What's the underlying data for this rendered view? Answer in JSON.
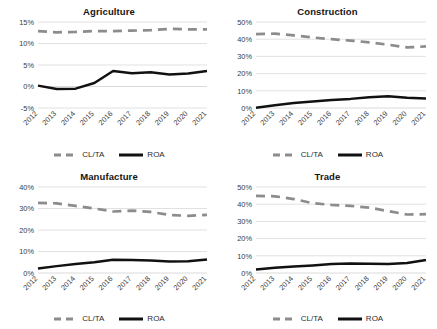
{
  "figure": {
    "background": "#ffffff",
    "panel_count": 4,
    "shared_legend_labels": [
      "CL/TA",
      "ROA"
    ],
    "series_colors": {
      "clta": "#8c8c8c",
      "roa": "#111111"
    }
  },
  "chart_data": [
    {
      "type": "line",
      "title": "Agriculture",
      "xlabel": "",
      "ylabel": "",
      "x": [
        "2012",
        "2013",
        "2014",
        "2015",
        "2016",
        "2017",
        "2018",
        "2019",
        "2020",
        "2021"
      ],
      "categories": [
        "2012",
        "2013",
        "2014",
        "2015",
        "2016",
        "2017",
        "2018",
        "2019",
        "2020",
        "2021"
      ],
      "yticks": [
        "-5%",
        "0%",
        "5%",
        "10%",
        "15%"
      ],
      "ytick_values": [
        -5,
        0,
        5,
        10,
        15
      ],
      "ylim": [
        -5,
        15
      ],
      "grid": true,
      "legend_position": "bottom",
      "series": [
        {
          "name": "CL/TA",
          "style": "dashed",
          "color": "#8c8c8c",
          "values": [
            12.9,
            12.6,
            12.7,
            12.9,
            12.9,
            13.0,
            13.1,
            13.4,
            13.3,
            13.3
          ]
        },
        {
          "name": "ROA",
          "style": "solid",
          "color": "#111111",
          "values": [
            0.2,
            -0.6,
            -0.5,
            0.8,
            3.6,
            3.1,
            3.3,
            2.8,
            3.0,
            3.6
          ]
        }
      ]
    },
    {
      "type": "line",
      "title": "Construction",
      "xlabel": "",
      "ylabel": "",
      "x": [
        "2012",
        "2013",
        "2014",
        "2015",
        "2016",
        "2017",
        "2018",
        "2019",
        "2020",
        "2021"
      ],
      "categories": [
        "2012",
        "2013",
        "2014",
        "2015",
        "2016",
        "2017",
        "2018",
        "2019",
        "2020",
        "2021"
      ],
      "yticks": [
        "0%",
        "10%",
        "20%",
        "30%",
        "40%",
        "50%"
      ],
      "ytick_values": [
        0,
        10,
        20,
        30,
        40,
        50
      ],
      "ylim": [
        0,
        50
      ],
      "grid": true,
      "legend_position": "bottom",
      "series": [
        {
          "name": "CL/TA",
          "style": "dashed",
          "color": "#8c8c8c",
          "values": [
            43.0,
            43.2,
            42.2,
            41.0,
            40.0,
            39.2,
            38.2,
            36.8,
            35.2,
            35.8
          ]
        },
        {
          "name": "ROA",
          "style": "solid",
          "color": "#111111",
          "values": [
            0.2,
            1.6,
            2.9,
            3.8,
            4.6,
            5.3,
            6.3,
            6.8,
            6.0,
            5.5
          ]
        }
      ]
    },
    {
      "type": "line",
      "title": "Manufacture",
      "xlabel": "",
      "ylabel": "",
      "x": [
        "2012",
        "2013",
        "2014",
        "2015",
        "2016",
        "2017",
        "2018",
        "2019",
        "2020",
        "2021"
      ],
      "categories": [
        "2012",
        "2013",
        "2014",
        "2015",
        "2016",
        "2017",
        "2018",
        "2019",
        "2020",
        "2021"
      ],
      "yticks": [
        "0%",
        "10%",
        "20%",
        "30%",
        "40%"
      ],
      "ytick_values": [
        0,
        10,
        20,
        30,
        40
      ],
      "ylim": [
        0,
        40
      ],
      "grid": true,
      "legend_position": "bottom",
      "series": [
        {
          "name": "CL/TA",
          "style": "dashed",
          "color": "#8c8c8c",
          "values": [
            32.6,
            32.4,
            31.2,
            30.0,
            28.6,
            29.0,
            28.4,
            27.0,
            26.6,
            27.0
          ]
        },
        {
          "name": "ROA",
          "style": "solid",
          "color": "#111111",
          "values": [
            2.1,
            3.2,
            4.2,
            5.0,
            6.2,
            6.0,
            5.8,
            5.4,
            5.5,
            6.3
          ]
        }
      ]
    },
    {
      "type": "line",
      "title": "Trade",
      "xlabel": "",
      "ylabel": "",
      "x": [
        "2012",
        "2013",
        "2014",
        "2015",
        "2016",
        "2017",
        "2018",
        "2019",
        "2020",
        "2021"
      ],
      "categories": [
        "2012",
        "2013",
        "2014",
        "2015",
        "2016",
        "2017",
        "2018",
        "2019",
        "2020",
        "2021"
      ],
      "yticks": [
        "0%",
        "10%",
        "20%",
        "30%",
        "40%",
        "50%"
      ],
      "ytick_values": [
        0,
        10,
        20,
        30,
        40,
        50
      ],
      "ylim": [
        0,
        50
      ],
      "grid": true,
      "legend_position": "bottom",
      "series": [
        {
          "name": "CL/TA",
          "style": "dashed",
          "color": "#8c8c8c",
          "values": [
            44.8,
            44.6,
            43.0,
            40.6,
            39.6,
            39.0,
            38.0,
            36.0,
            34.0,
            34.2
          ]
        },
        {
          "name": "ROA",
          "style": "solid",
          "color": "#111111",
          "values": [
            2.0,
            3.0,
            3.8,
            4.4,
            5.2,
            5.5,
            5.4,
            5.2,
            5.8,
            7.6
          ]
        }
      ]
    }
  ]
}
